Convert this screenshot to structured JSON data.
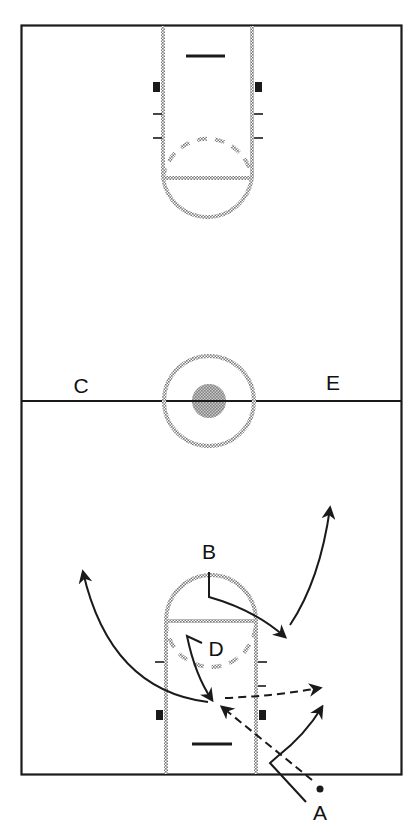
{
  "diagram": {
    "type": "basketball-half-court-play",
    "colors": {
      "line": "#1a1a1a",
      "shaded_marking": "#9a9a9a",
      "center_fill": "#8c8c8c",
      "background": "#ffffff"
    },
    "players": [
      {
        "id": "A",
        "label": "A",
        "x": 320,
        "y": 812
      },
      {
        "id": "B",
        "label": "B",
        "x": 209,
        "y": 551
      },
      {
        "id": "C",
        "label": "C",
        "x": 81,
        "y": 385
      },
      {
        "id": "D",
        "label": "D",
        "x": 216,
        "y": 648
      },
      {
        "id": "E",
        "label": "E",
        "x": 333,
        "y": 382
      }
    ],
    "ball": {
      "holder": "A",
      "x": 320,
      "y": 789
    },
    "movements": [
      {
        "from": "A",
        "kind": "cut",
        "style": "solid"
      },
      {
        "from": "A",
        "kind": "pass",
        "style": "dashed"
      },
      {
        "from": "B",
        "kind": "cut",
        "style": "solid"
      },
      {
        "from": "D",
        "kind": "cut",
        "style": "solid"
      },
      {
        "from": "D",
        "kind": "pass",
        "style": "dashed"
      },
      {
        "kind": "cut-left-wing",
        "style": "solid"
      },
      {
        "kind": "cut-right-wing",
        "style": "solid"
      }
    ]
  }
}
